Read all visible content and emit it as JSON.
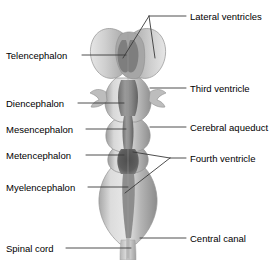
{
  "figure": {
    "background_color": "#ffffff",
    "text_color": "#000000",
    "leader_color": "#3a3a3a",
    "illustration": {
      "name": "brain-midsagittal-dorsal-view",
      "palette": {
        "outer_light": "#d2d2d2",
        "outer_mid": "#bdbdbd",
        "outer_shadow": "#9a9a9a",
        "ventricle_mid": "#8e8e8e",
        "ventricle_dark": "#565656",
        "outline": "#8b8b8b",
        "highlight": "#ececec"
      }
    }
  },
  "labels_left": [
    {
      "id": "telencephalon",
      "text": "Telencephalon",
      "x": 6,
      "y": 50,
      "leader_x1": 82,
      "leader_y1": 55,
      "leader_x2": 126,
      "leader_y2": 55
    },
    {
      "id": "diencephalon",
      "text": "Diencephalon",
      "x": 6,
      "y": 98,
      "leader_x1": 78,
      "leader_y1": 103,
      "leader_x2": 124,
      "leader_y2": 103
    },
    {
      "id": "mesencephalon",
      "text": "Mesencephalon",
      "x": 6,
      "y": 124,
      "leader_x1": 86,
      "leader_y1": 129,
      "leader_x2": 126,
      "leader_y2": 129
    },
    {
      "id": "metencephalon",
      "text": "Metencephalon",
      "x": 6,
      "y": 150,
      "leader_x1": 86,
      "leader_y1": 155,
      "leader_x2": 124,
      "leader_y2": 155
    },
    {
      "id": "myelencephalon",
      "text": "Myelencephalon",
      "x": 6,
      "y": 182,
      "leader_x1": 88,
      "leader_y1": 187,
      "leader_x2": 128,
      "leader_y2": 187
    },
    {
      "id": "spinal-cord",
      "text": "Spinal cord",
      "x": 6,
      "y": 243,
      "leader_x1": 66,
      "leader_y1": 248,
      "leader_x2": 131,
      "leader_y2": 248
    }
  ],
  "labels_right": [
    {
      "id": "lateral-ventricles",
      "text": "Lateral ventricles",
      "x": 190,
      "y": 11,
      "leader_x1": 186,
      "leader_y1": 16,
      "leader_x2": 149,
      "leader_y2": 16
    },
    {
      "id": "third-ventricle",
      "text": "Third ventricle",
      "x": 190,
      "y": 83,
      "leader_x1": 186,
      "leader_y1": 88,
      "leader_x2": 150,
      "leader_y2": 88
    },
    {
      "id": "cerebral-aqueduct",
      "text": "Cerebral aqueduct",
      "x": 190,
      "y": 122,
      "leader_x1": 186,
      "leader_y1": 127,
      "leader_x2": 150,
      "leader_y2": 127
    },
    {
      "id": "fourth-ventricle",
      "text": "Fourth ventricle",
      "x": 190,
      "y": 153,
      "leader_x1": 186,
      "leader_y1": 158,
      "leader_x2": 170,
      "leader_y2": 158
    },
    {
      "id": "central-canal",
      "text": "Central canal",
      "x": 190,
      "y": 233,
      "leader_x1": 186,
      "leader_y1": 238,
      "leader_x2": 140,
      "leader_y2": 238
    }
  ],
  "leaders_branched": {
    "lateral_ventricles": {
      "apex_x": 149,
      "apex_y": 16,
      "tip_left_x": 123,
      "tip_left_y": 58,
      "tip_right_x": 155,
      "tip_right_y": 58
    },
    "fourth_ventricle": {
      "apex_x": 170,
      "apex_y": 158,
      "tip_upper_x": 133,
      "tip_upper_y": 152,
      "tip_lower_x": 125,
      "tip_lower_y": 193
    }
  }
}
